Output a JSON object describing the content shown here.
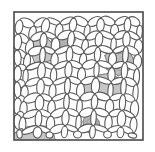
{
  "figure": {
    "kind": "micrograph-illustration",
    "subject": "cellular foam microstructure with shaded inclusions",
    "background_color": "#ffffff",
    "canvas": {
      "width": 155,
      "height": 152
    }
  },
  "frame": {
    "name": "image-border",
    "x": 14,
    "y": 12,
    "width": 129,
    "height": 128,
    "stroke_color": "#4a4a4a",
    "stroke_width": 1.6,
    "fill_color": "#ffffff"
  },
  "style": {
    "strut_stroke": "#5a5a5a",
    "strut_stroke_width": 1.1,
    "strut_fill": "#ffffff",
    "inclusion_fill": "#c6c6c6",
    "inclusion_fill_dark": "#b4b4b4",
    "inclusion_stroke": "#6b6b6b",
    "hatch_color": "#9a9a9a"
  },
  "inclusions": [
    {
      "label": "inclusion-upper-left",
      "cx": 41,
      "cy": 50,
      "rx": 13,
      "ry": 15,
      "rotation": -20,
      "fill": "#c6c6c6",
      "hatched": false
    },
    {
      "label": "inclusion-upper-mid",
      "cx": 63,
      "cy": 42,
      "rx": 12,
      "ry": 8,
      "rotation": -12,
      "fill": "#b4b4b4",
      "hatched": true
    },
    {
      "label": "inclusion-right-large",
      "cx": 119,
      "cy": 62,
      "rx": 14,
      "ry": 14,
      "rotation": 10,
      "fill": "#c2c2c2",
      "hatched": true
    },
    {
      "label": "inclusion-center-right",
      "cx": 104,
      "cy": 88,
      "rx": 23,
      "ry": 13,
      "rotation": 0,
      "fill": "#c6c6c6",
      "hatched": false
    },
    {
      "label": "inclusion-bottom-mid",
      "cx": 92,
      "cy": 124,
      "rx": 9,
      "ry": 9,
      "rotation": 0,
      "fill": "#b8b8b8",
      "hatched": true
    },
    {
      "label": "inclusion-bottom-left",
      "cx": 34,
      "cy": 135,
      "rx": 22,
      "ry": 10,
      "rotation": 0,
      "fill": "#c6c6c6",
      "hatched": false
    }
  ],
  "counts": {
    "inclusion_count": 6,
    "strut_count": 96
  },
  "struts": [
    [
      20,
      20,
      34,
      26
    ],
    [
      34,
      26,
      47,
      19
    ],
    [
      47,
      19,
      60,
      24
    ],
    [
      60,
      24,
      74,
      18
    ],
    [
      74,
      18,
      88,
      25
    ],
    [
      88,
      25,
      101,
      18
    ],
    [
      101,
      18,
      115,
      24
    ],
    [
      115,
      24,
      128,
      18
    ],
    [
      128,
      18,
      140,
      25
    ],
    [
      20,
      20,
      18,
      34
    ],
    [
      34,
      26,
      31,
      40
    ],
    [
      47,
      19,
      44,
      33
    ],
    [
      60,
      24,
      58,
      38
    ],
    [
      74,
      18,
      72,
      32
    ],
    [
      88,
      25,
      86,
      39
    ],
    [
      101,
      18,
      100,
      32
    ],
    [
      115,
      24,
      114,
      38
    ],
    [
      128,
      18,
      127,
      32
    ],
    [
      140,
      25,
      139,
      39
    ],
    [
      18,
      34,
      29,
      43
    ],
    [
      31,
      40,
      44,
      33
    ],
    [
      44,
      33,
      56,
      38
    ],
    [
      58,
      38,
      72,
      32
    ],
    [
      72,
      32,
      86,
      39
    ],
    [
      86,
      39,
      100,
      32
    ],
    [
      100,
      32,
      114,
      38
    ],
    [
      114,
      38,
      127,
      32
    ],
    [
      127,
      32,
      139,
      39
    ],
    [
      18,
      34,
      17,
      50
    ],
    [
      31,
      40,
      28,
      54
    ],
    [
      44,
      33,
      43,
      48
    ],
    [
      56,
      38,
      55,
      53
    ],
    [
      72,
      32,
      70,
      47
    ],
    [
      86,
      39,
      84,
      53
    ],
    [
      100,
      32,
      98,
      47
    ],
    [
      114,
      38,
      113,
      52
    ],
    [
      127,
      32,
      126,
      47
    ],
    [
      139,
      39,
      138,
      54
    ],
    [
      17,
      50,
      27,
      58
    ],
    [
      28,
      54,
      43,
      48
    ],
    [
      43,
      48,
      55,
      53
    ],
    [
      55,
      53,
      70,
      47
    ],
    [
      70,
      47,
      84,
      53
    ],
    [
      84,
      53,
      98,
      47
    ],
    [
      98,
      47,
      113,
      52
    ],
    [
      113,
      52,
      126,
      47
    ],
    [
      126,
      47,
      138,
      54
    ],
    [
      17,
      50,
      18,
      66
    ],
    [
      28,
      54,
      26,
      69
    ],
    [
      43,
      48,
      42,
      63
    ],
    [
      55,
      53,
      54,
      68
    ],
    [
      70,
      47,
      69,
      62
    ],
    [
      84,
      53,
      82,
      67
    ],
    [
      98,
      47,
      97,
      62
    ],
    [
      113,
      52,
      112,
      67
    ],
    [
      126,
      47,
      125,
      63
    ],
    [
      138,
      54,
      137,
      69
    ],
    [
      18,
      66,
      26,
      69
    ],
    [
      26,
      69,
      42,
      63
    ],
    [
      42,
      63,
      54,
      68
    ],
    [
      54,
      68,
      69,
      62
    ],
    [
      69,
      62,
      82,
      67
    ],
    [
      82,
      67,
      97,
      62
    ],
    [
      97,
      62,
      112,
      67
    ],
    [
      112,
      67,
      125,
      63
    ],
    [
      125,
      63,
      137,
      69
    ],
    [
      18,
      66,
      17,
      82
    ],
    [
      26,
      69,
      25,
      85
    ],
    [
      42,
      63,
      41,
      79
    ],
    [
      54,
      68,
      53,
      84
    ],
    [
      69,
      62,
      68,
      78
    ],
    [
      82,
      67,
      81,
      83
    ],
    [
      97,
      62,
      96,
      78
    ],
    [
      112,
      67,
      111,
      83
    ],
    [
      125,
      63,
      124,
      79
    ],
    [
      137,
      69,
      136,
      85
    ],
    [
      17,
      82,
      25,
      85
    ],
    [
      25,
      85,
      41,
      79
    ],
    [
      41,
      79,
      53,
      84
    ],
    [
      53,
      84,
      68,
      78
    ],
    [
      68,
      78,
      81,
      83
    ],
    [
      81,
      83,
      96,
      78
    ],
    [
      96,
      78,
      111,
      83
    ],
    [
      111,
      83,
      124,
      79
    ],
    [
      124,
      79,
      136,
      85
    ],
    [
      17,
      82,
      18,
      98
    ],
    [
      25,
      85,
      24,
      101
    ],
    [
      41,
      79,
      40,
      95
    ],
    [
      53,
      84,
      52,
      100
    ],
    [
      68,
      78,
      67,
      94
    ],
    [
      81,
      83,
      80,
      99
    ],
    [
      96,
      78,
      95,
      94
    ],
    [
      111,
      83,
      110,
      99
    ],
    [
      124,
      79,
      123,
      95
    ],
    [
      136,
      85,
      135,
      101
    ],
    [
      18,
      98,
      24,
      101
    ],
    [
      24,
      101,
      40,
      95
    ],
    [
      40,
      95,
      52,
      100
    ],
    [
      52,
      100,
      67,
      94
    ],
    [
      67,
      94,
      80,
      99
    ],
    [
      80,
      99,
      95,
      94
    ],
    [
      95,
      94,
      110,
      99
    ],
    [
      110,
      99,
      123,
      95
    ],
    [
      123,
      95,
      135,
      101
    ],
    [
      18,
      98,
      17,
      114
    ],
    [
      24,
      101,
      23,
      117
    ],
    [
      40,
      95,
      39,
      111
    ],
    [
      52,
      100,
      51,
      116
    ],
    [
      67,
      94,
      66,
      110
    ],
    [
      80,
      99,
      79,
      115
    ],
    [
      95,
      94,
      94,
      110
    ],
    [
      110,
      99,
      109,
      115
    ],
    [
      123,
      95,
      122,
      111
    ],
    [
      135,
      101,
      134,
      117
    ],
    [
      17,
      114,
      23,
      117
    ],
    [
      23,
      117,
      39,
      111
    ],
    [
      39,
      111,
      51,
      116
    ],
    [
      51,
      116,
      66,
      110
    ],
    [
      66,
      110,
      79,
      115
    ],
    [
      79,
      115,
      94,
      110
    ],
    [
      94,
      110,
      109,
      115
    ],
    [
      109,
      115,
      122,
      111
    ],
    [
      122,
      111,
      134,
      117
    ],
    [
      17,
      114,
      19,
      130
    ],
    [
      23,
      117,
      22,
      133
    ],
    [
      39,
      111,
      38,
      127
    ],
    [
      51,
      116,
      50,
      132
    ],
    [
      66,
      110,
      65,
      126
    ],
    [
      79,
      115,
      78,
      131
    ],
    [
      94,
      110,
      93,
      126
    ],
    [
      109,
      115,
      108,
      131
    ],
    [
      122,
      111,
      121,
      127
    ],
    [
      134,
      117,
      133,
      133
    ],
    [
      19,
      130,
      22,
      133
    ],
    [
      22,
      133,
      38,
      127
    ],
    [
      38,
      127,
      50,
      132
    ],
    [
      50,
      132,
      65,
      126
    ],
    [
      65,
      126,
      78,
      131
    ],
    [
      78,
      131,
      93,
      126
    ],
    [
      93,
      126,
      108,
      131
    ],
    [
      108,
      131,
      121,
      127
    ],
    [
      121,
      127,
      133,
      133
    ],
    [
      19,
      130,
      20,
      138
    ],
    [
      38,
      127,
      37,
      138
    ],
    [
      50,
      132,
      49,
      138
    ],
    [
      65,
      126,
      64,
      138
    ],
    [
      78,
      131,
      77,
      138
    ],
    [
      93,
      126,
      92,
      138
    ],
    [
      108,
      131,
      107,
      138
    ],
    [
      121,
      127,
      120,
      138
    ],
    [
      133,
      133,
      132,
      138
    ]
  ]
}
